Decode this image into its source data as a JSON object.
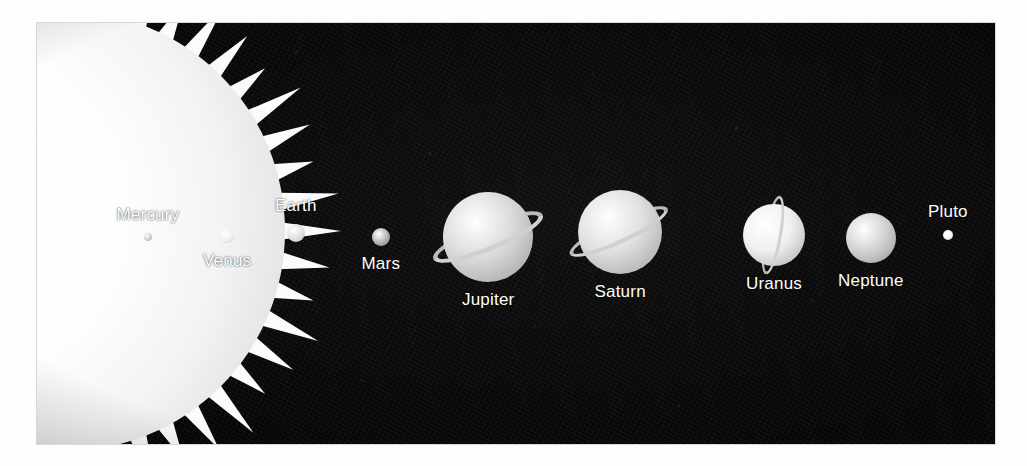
{
  "figure": {
    "type": "solar-system-diagram",
    "background_color": "#080808",
    "plate": {
      "x": 37,
      "y": 23,
      "width": 958,
      "height": 421
    },
    "page_background": "#ffffff"
  },
  "sun": {
    "label": "Sun",
    "label_color": "#3a3a3a",
    "body_color": "#ffffff",
    "rays": 46,
    "center": {
      "x": -224,
      "y": 208
    },
    "radius": 220
  },
  "bodies": [
    {
      "name": "Mercury",
      "label": "Mercury",
      "label_position": "above",
      "center": {
        "x": 111,
        "y": 214
      },
      "radius": 4,
      "color": "#c9c9c9",
      "has_ring": false
    },
    {
      "name": "Venus",
      "label": "Venus",
      "label_position": "below",
      "center": {
        "x": 190,
        "y": 213
      },
      "radius": 7,
      "color": "#ededed",
      "has_ring": false
    },
    {
      "name": "Earth",
      "label": "Earth",
      "label_position": "above",
      "center": {
        "x": 259,
        "y": 210
      },
      "radius": 9,
      "color": "#dcdcdc",
      "has_ring": false
    },
    {
      "name": "Mars",
      "label": "Mars",
      "label_position": "below",
      "center": {
        "x": 344,
        "y": 214
      },
      "radius": 9,
      "color": "#a8a8a8",
      "has_ring": false
    },
    {
      "name": "Jupiter",
      "label": "Jupiter",
      "label_position": "below",
      "center": {
        "x": 451,
        "y": 214
      },
      "radius": 45,
      "color": "#d9d9d9",
      "has_ring": true,
      "ring_tilt_deg": -22
    },
    {
      "name": "Saturn",
      "label": "Saturn",
      "label_position": "below",
      "center": {
        "x": 583,
        "y": 209
      },
      "radius": 42,
      "color": "#dedede",
      "has_ring": true,
      "ring_tilt_deg": -25
    },
    {
      "name": "Uranus",
      "label": "Uranus",
      "label_position": "below",
      "center": {
        "x": 737,
        "y": 212
      },
      "radius": 31,
      "color": "#f0f0f0",
      "has_ring": true,
      "ring_tilt_deg": -80
    },
    {
      "name": "Neptune",
      "label": "Neptune",
      "label_position": "below",
      "center": {
        "x": 834,
        "y": 215
      },
      "radius": 25,
      "color": "#d4d4d4",
      "has_ring": false
    },
    {
      "name": "Pluto",
      "label": "Pluto",
      "label_position": "above",
      "center": {
        "x": 911,
        "y": 212
      },
      "radius": 5,
      "color": "#f2f2f2",
      "has_ring": false
    }
  ],
  "labels": {
    "sun": "Sun",
    "mercury": "Mercury",
    "venus": "Venus",
    "earth": "Earth",
    "mars": "Mars",
    "jupiter": "Jupiter",
    "saturn": "Saturn",
    "uranus": "Uranus",
    "neptune": "Neptune",
    "pluto": "Pluto"
  }
}
